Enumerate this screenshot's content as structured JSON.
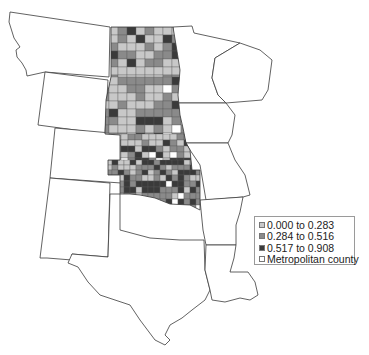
{
  "map": {
    "region": "Great Plains and surrounding states",
    "states": [
      {
        "name": "Montana",
        "points": "10,12 110,27 109,77 45,72 27,76 26,70 22,63 17,57 16,50 20,47 14,38 9,22"
      },
      {
        "name": "Wyoming",
        "points": "45,72 108,80 105,134 38,125"
      },
      {
        "name": "Colorado",
        "points": "55,128 122,134 121,183 50,178"
      },
      {
        "name": "New Mexico",
        "points": "50,178 110,183 108,257 72,254 72,260 47,258 40,258"
      },
      {
        "name": "Texas",
        "points": "72,254 108,257 110,194 120,194 120,230 150,238 180,240 204,240 205,270 210,290 205,300 192,310 182,318 170,325 165,335 170,340 165,345 155,340 140,320 130,305 115,300 100,295 88,282 78,267 68,263"
      },
      {
        "name": "Minnesota",
        "points": "173,27 192,26 194,33 240,43 215,58 212,78 218,95 226,103 176,103"
      },
      {
        "name": "Iowa",
        "points": "178,103 226,103 235,115 232,135 228,143 186,143 180,128"
      },
      {
        "name": "Missouri",
        "points": "186,143 228,143 235,160 245,175 250,195 243,197 206,200 200,165 190,150"
      },
      {
        "name": "Arkansas",
        "points": "200,200 243,197 240,212 236,225 236,245 206,245 203,230"
      },
      {
        "name": "Louisiana",
        "points": "206,245 236,245 234,258 230,272 248,272 255,282 258,295 250,300 240,298 225,302 212,300 210,290 205,270"
      },
      {
        "name": "Wisconsin",
        "points": "240,43 260,50 272,60 270,75 268,90 262,100 226,103 218,95 212,78 215,58"
      }
    ],
    "county_region": {
      "name": "ND-SD-NE-KS-OK",
      "outline": "111,27 173,27 176,45 180,70 178,95 180,115 183,128 186,143 190,150 192,170 200,170 200,210 190,205 170,204 155,198 140,195 130,194 120,194 120,175 108,175 108,160 120,160 120,135 105,134 106,100 111,77"
    },
    "colors": {
      "class_low": "#c8c8c8",
      "class_mid": "#8a8a8a",
      "class_high": "#3a3a3a",
      "metropolitan": "#ffffff",
      "border": "#3a3a3a"
    }
  },
  "legend": {
    "items": [
      {
        "label": "0.000 to 0.283",
        "color": "#c8c8c8"
      },
      {
        "label": "0.284 to 0.516",
        "color": "#8a8a8a"
      },
      {
        "label": "0.517 to 0.908",
        "color": "#3a3a3a"
      },
      {
        "label": "Metropolitan county",
        "color": "#ffffff"
      }
    ]
  }
}
